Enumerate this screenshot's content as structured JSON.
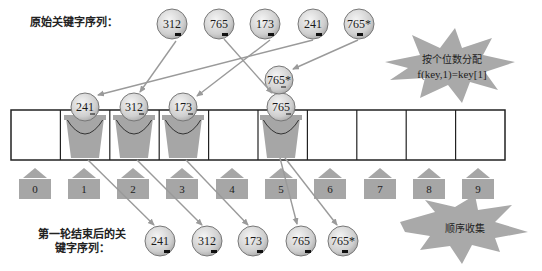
{
  "labels": {
    "original_sequence": "原始关键字序列：",
    "after_round_line1": "第一轮结束后的关",
    "after_round_line2": "键字序列："
  },
  "callouts": {
    "distribute_line1": "按个位数分配",
    "distribute_line2": "f(key,1)=key[1]",
    "collect": "顺序收集"
  },
  "original_keys": [
    {
      "value": "312",
      "bucket": 2
    },
    {
      "value": "765",
      "bucket": 5
    },
    {
      "value": "173",
      "bucket": 3
    },
    {
      "value": "241",
      "bucket": 1
    },
    {
      "value": "765*",
      "bucket": 5
    }
  ],
  "bucket_indices": [
    "0",
    "1",
    "2",
    "3",
    "4",
    "5",
    "6",
    "7",
    "8",
    "9"
  ],
  "bucket_contents": [
    {
      "bucket": 1,
      "values": [
        "241"
      ]
    },
    {
      "bucket": 2,
      "values": [
        "312"
      ]
    },
    {
      "bucket": 3,
      "values": [
        "173"
      ]
    },
    {
      "bucket": 5,
      "values": [
        "765",
        "765*"
      ]
    }
  ],
  "collected_keys": [
    "241",
    "312",
    "173",
    "765",
    "765*"
  ],
  "colors": {
    "ball_fill_light": "#e8e8e8",
    "ball_fill_dark": "#b5b5b5",
    "bucket_gray": "#a6a6a6",
    "arrow_gray": "#9a9a9a",
    "star_gray": "#a9a9a9",
    "grid_line": "#222222"
  }
}
